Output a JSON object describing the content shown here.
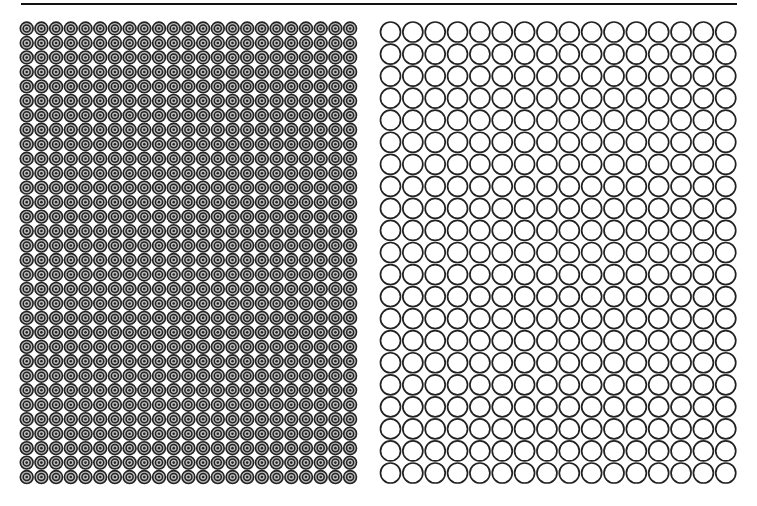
{
  "top_rule": {
    "x": 21,
    "y": 3,
    "width": 716,
    "height": 2,
    "color": "#111111"
  },
  "left_grid": {
    "pattern": "concentric-target",
    "columns": 23,
    "rows": 32,
    "origin_x": 26.7,
    "origin_y": 28.5,
    "pitch_x": 14.7,
    "pitch_y": 14.47,
    "outer_radius": 6.4,
    "ring_color": "#222222",
    "gap_color": "#bdbdbd"
  },
  "right_grid": {
    "pattern": "hollow-circle",
    "columns": 16,
    "rows": 21,
    "origin_x": 390.5,
    "origin_y": 32,
    "pitch_x": 22.35,
    "pitch_y": 22.05,
    "radius": 10,
    "stroke_width": 1.7,
    "stroke_color": "#222222"
  }
}
